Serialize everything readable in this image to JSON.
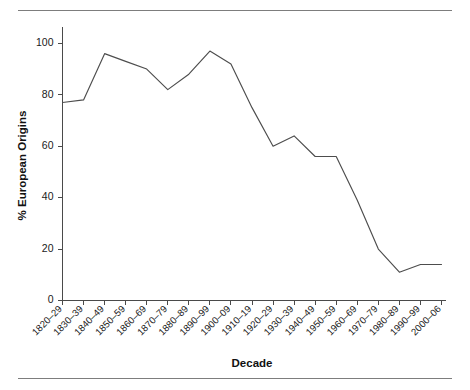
{
  "figure": {
    "has_top_rule": true,
    "has_bottom_rule": true,
    "background_color": "#ffffff",
    "line_color": "#4d4d4d",
    "axis_color": "#4a4a4a"
  },
  "chart_data": {
    "type": "line",
    "title": "",
    "xlabel": "Decade",
    "ylabel": "% European Origins",
    "categories": [
      "1820–29",
      "1830–39",
      "1840–49",
      "1850–59",
      "1860–69",
      "1870–79",
      "1880–89",
      "1890–99",
      "1900–09",
      "1910–19",
      "1920–29",
      "1930–39",
      "1940–49",
      "1950–59",
      "1960–69",
      "1970–79",
      "1980–89",
      "1990–99",
      "2000–06"
    ],
    "values": [
      77,
      78,
      96,
      93,
      90,
      82,
      88,
      97,
      92,
      75,
      60,
      64,
      56,
      56,
      39,
      20,
      11,
      14,
      14
    ],
    "xlim": [
      0,
      18
    ],
    "ylim": [
      0,
      105
    ],
    "yticks": [
      0,
      20,
      40,
      60,
      80,
      100
    ],
    "ytick_labels": [
      "0",
      "20",
      "40",
      "60",
      "80",
      "100"
    ],
    "grid": false,
    "legend": false,
    "legend_position": "none",
    "xtick_label_rotation": 45
  }
}
